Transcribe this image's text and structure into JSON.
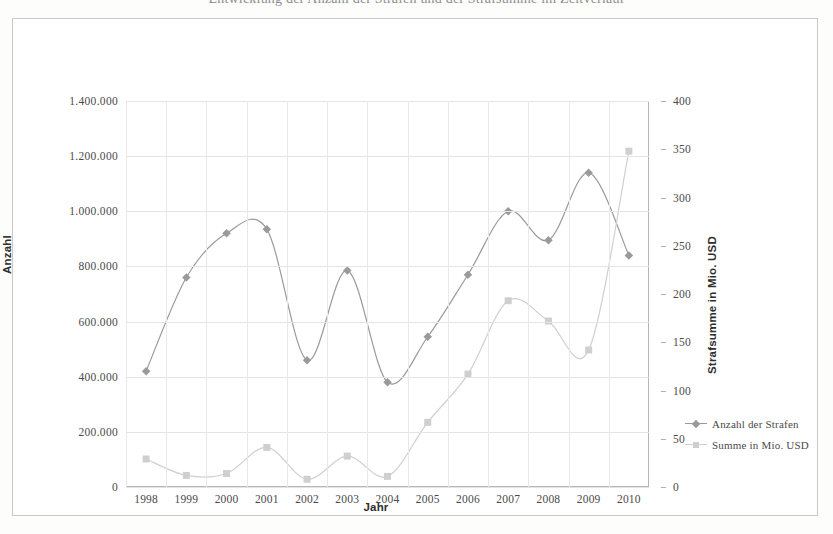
{
  "caption_clipped": "Entwicklung der Anzahl der Strafen und der Strafsumme im Zeitverlauf",
  "axes": {
    "x_title": "Jahr",
    "y_left_title": "Anzahl",
    "y_right_title": "Strafsumme in Mio. USD",
    "y_left_ticks": [
      "0",
      "200.000",
      "400.000",
      "600.000",
      "800.000",
      "1.000.000",
      "1.200.000",
      "1.400.000"
    ],
    "y_right_ticks": [
      "0",
      "50",
      "100",
      "150",
      "200",
      "250",
      "300",
      "350",
      "400"
    ],
    "x_ticks": [
      "1998",
      "1999",
      "2000",
      "2001",
      "2002",
      "2003",
      "2004",
      "2005",
      "2006",
      "2007",
      "2008",
      "2009",
      "2010"
    ]
  },
  "legend": {
    "position": "right-middle",
    "items": [
      {
        "label": "Anzahl der Strafen",
        "marker": "diamond",
        "color": "#9a9a9a"
      },
      {
        "label": "Summe in Mio. USD",
        "marker": "square",
        "color": "#cfcfcf"
      }
    ]
  },
  "colors": {
    "series_anzahl": "#9a9a9a",
    "series_summe": "#cfcfcf",
    "grid": "#e4e4e4",
    "axis": "#b5b5b5",
    "frame": "#c9c9c9",
    "text": "#4a4a4a"
  },
  "chart_data": {
    "type": "line",
    "title": "",
    "subtitle": "",
    "xlabel": "Jahr",
    "ylabel": "Anzahl",
    "y2label": "Strafsumme in Mio. USD",
    "grid": true,
    "legend_position": "right",
    "smoothed": true,
    "x": [
      1998,
      1999,
      2000,
      2001,
      2002,
      2003,
      2004,
      2005,
      2006,
      2007,
      2008,
      2009,
      2010
    ],
    "categories": [
      "1998",
      "1999",
      "2000",
      "2001",
      "2002",
      "2003",
      "2004",
      "2005",
      "2006",
      "2007",
      "2008",
      "2009",
      "2010"
    ],
    "ylim": [
      0,
      1400000
    ],
    "y2lim": [
      0,
      400
    ],
    "yticks": [
      0,
      200000,
      400000,
      600000,
      800000,
      1000000,
      1200000,
      1400000
    ],
    "y2ticks": [
      0,
      50,
      100,
      150,
      200,
      250,
      300,
      350,
      400
    ],
    "series": [
      {
        "name": "Anzahl der Strafen",
        "axis": "left",
        "marker": "diamond",
        "color": "#9a9a9a",
        "values": [
          420000,
          760000,
          920000,
          935000,
          460000,
          785000,
          380000,
          545000,
          770000,
          1000000,
          895000,
          1140000,
          840000
        ]
      },
      {
        "name": "Summe in Mio. USD",
        "axis": "right",
        "marker": "square",
        "color": "#cfcfcf",
        "values": [
          29,
          12,
          14,
          41,
          8,
          32,
          11,
          67,
          117,
          193,
          172,
          142,
          348
        ]
      }
    ]
  }
}
